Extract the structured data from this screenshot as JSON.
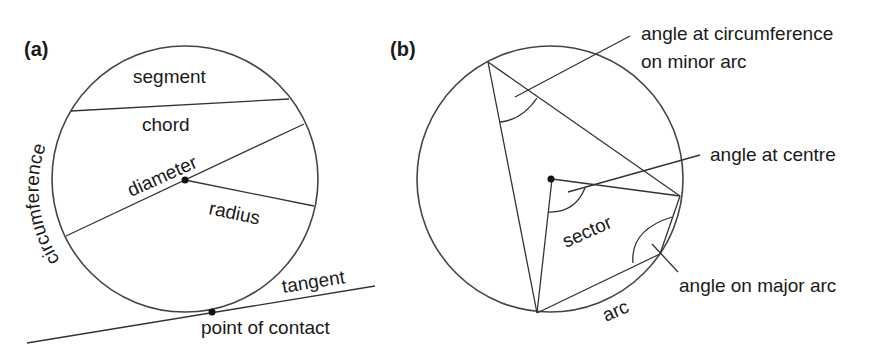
{
  "panels": {
    "a": {
      "label": "(a)",
      "terms": {
        "segment": "segment",
        "chord": "chord",
        "diameter": "diameter",
        "radius": "radius",
        "circumference": "circumference",
        "tangent": "tangent",
        "point_of_contact": "point of contact"
      }
    },
    "b": {
      "label": "(b)",
      "terms": {
        "angle_circumference_line1": "angle at circumference",
        "angle_circumference_line2": "on minor arc",
        "angle_at_centre": "angle at centre",
        "sector": "sector",
        "angle_major_arc": "angle on major arc",
        "arc": "arc"
      }
    }
  }
}
